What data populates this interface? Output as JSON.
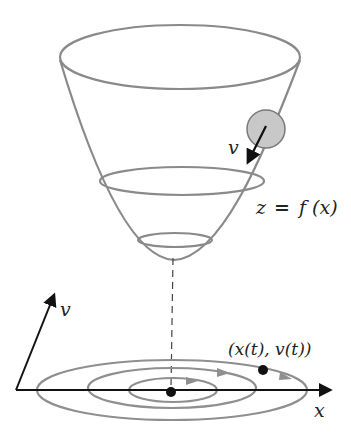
{
  "diagram": {
    "labels": {
      "velocity_ball": "v",
      "surface": "z = f (x)",
      "surface_lhs": "z",
      "surface_eq": "=",
      "surface_rhs": "f (x)",
      "v_axis": "v",
      "x_axis": "x",
      "trajectory_point": "(x(t), v(t))"
    },
    "colors": {
      "surface_stroke": "#8a8a8a",
      "ball_fill": "#c8c8c8",
      "ball_stroke": "#7a7a7a",
      "axes": "#111111",
      "orbit_stroke": "#8f8f8f",
      "background": "#ffffff"
    },
    "elements": [
      {
        "name": "bowl-surface",
        "type": "paraboloid"
      },
      {
        "name": "ball",
        "type": "circle"
      },
      {
        "name": "level-rings",
        "count": 3
      },
      {
        "name": "phase-orbits",
        "count": 3
      },
      {
        "name": "projection-line",
        "style": "dashed"
      }
    ]
  }
}
